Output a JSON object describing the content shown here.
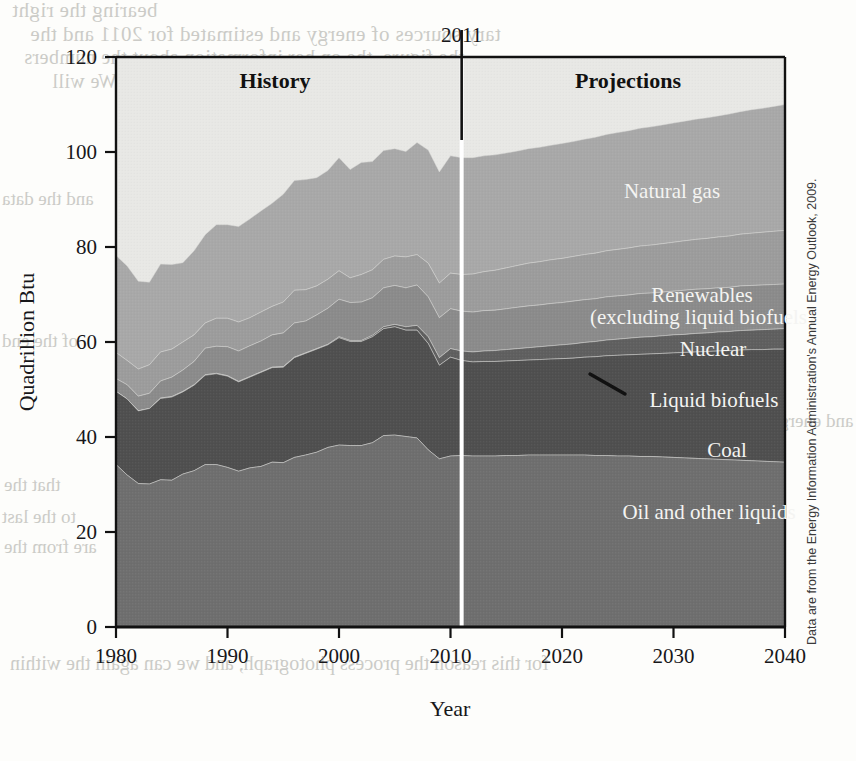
{
  "figure": {
    "period_labels": [
      {
        "text": "History",
        "x": 275,
        "y": 88
      },
      {
        "text": "Projections",
        "x": 628,
        "y": 88
      }
    ],
    "divider_year": "2011",
    "source_note": "Data are from the Energy Information Administration's Annual Energy Outlook, 2009.",
    "bleed_through": [
      "bearing the right ",
      "tary sources of energy and estimated for 2011 and the",
      "the figure, the on her information about the numbers",
      "er the official site of the Department of Energy, We will",
      "of energy and the energy quantities in the",
      "and the data",
      "of the end",
      "that the",
      "to the last",
      "are from the",
      "and the",
      "for this reason the process photograph, and we can again the within",
      "and energy"
    ]
  },
  "chart_data": {
    "type": "area",
    "title": "",
    "subtitle": "",
    "xlabel": "Year",
    "ylabel": "Quadrillion Btu",
    "xlim": [
      1980,
      2040
    ],
    "ylim": [
      0,
      120
    ],
    "xticks": [
      1980,
      1990,
      2000,
      2010,
      2020,
      2030,
      2040
    ],
    "yticks": [
      0,
      20,
      40,
      60,
      80,
      100,
      120
    ],
    "grid": false,
    "stacked": true,
    "legend_position": "inline-annotations",
    "divider": {
      "x": 2011,
      "label": "2011",
      "left_region": "History",
      "right_region": "Projections"
    },
    "colors": {
      "oil_and_other_liquids": "#6e6e6e",
      "coal": "#4f4f4f",
      "liquid_biofuels": "#5f5f5f",
      "nuclear": "#8b8b8b",
      "renewables": "#9c9c9c",
      "natural_gas": "#a8a8a8",
      "plot_background": "#e8e8e5",
      "divider_line": "#111111",
      "projection_split_line": "#ffffff"
    },
    "x": [
      1980,
      1981,
      1982,
      1983,
      1984,
      1985,
      1986,
      1987,
      1988,
      1989,
      1990,
      1991,
      1992,
      1993,
      1994,
      1995,
      1996,
      1997,
      1998,
      1999,
      2000,
      2001,
      2002,
      2003,
      2004,
      2005,
      2006,
      2007,
      2008,
      2009,
      2010,
      2011,
      2012,
      2013,
      2014,
      2015,
      2016,
      2017,
      2018,
      2019,
      2020,
      2021,
      2022,
      2023,
      2024,
      2025,
      2026,
      2027,
      2028,
      2029,
      2030,
      2031,
      2032,
      2033,
      2034,
      2035,
      2036,
      2037,
      2038,
      2039,
      2040
    ],
    "series": [
      {
        "name": "Oil and other liquids",
        "label": "Oil and other liquids",
        "color": "#6e6e6e",
        "values": [
          34.2,
          32.0,
          30.2,
          30.1,
          31.0,
          30.9,
          32.2,
          32.9,
          34.2,
          34.2,
          33.6,
          32.8,
          33.5,
          33.8,
          34.7,
          34.6,
          35.7,
          36.2,
          36.8,
          37.8,
          38.3,
          38.2,
          38.2,
          38.8,
          40.3,
          40.4,
          40.1,
          39.8,
          37.3,
          35.4,
          36.0,
          36.1,
          36.0,
          36.0,
          36.0,
          36.1,
          36.1,
          36.2,
          36.2,
          36.2,
          36.2,
          36.2,
          36.2,
          36.1,
          36.1,
          36.0,
          36.0,
          35.9,
          35.9,
          35.8,
          35.7,
          35.6,
          35.5,
          35.4,
          35.3,
          35.2,
          35.1,
          35.0,
          34.9,
          34.8,
          34.7
        ]
      },
      {
        "name": "Coal",
        "label": "Coal",
        "color": "#4f4f4f",
        "values": [
          15.4,
          16.0,
          15.3,
          15.9,
          17.1,
          17.5,
          17.3,
          18.0,
          18.8,
          19.1,
          19.2,
          18.8,
          19.1,
          19.8,
          19.9,
          20.1,
          21.0,
          21.4,
          21.7,
          21.6,
          22.6,
          21.9,
          21.9,
          22.3,
          22.5,
          22.8,
          22.4,
          22.7,
          22.4,
          19.7,
          20.8,
          20.0,
          19.8,
          19.9,
          19.9,
          19.9,
          20.0,
          20.0,
          20.1,
          20.2,
          20.3,
          20.4,
          20.6,
          20.8,
          21.0,
          21.2,
          21.3,
          21.5,
          21.6,
          21.8,
          22.0,
          22.2,
          22.4,
          22.6,
          22.8,
          23.0,
          23.2,
          23.4,
          23.5,
          23.7,
          23.8
        ]
      },
      {
        "name": "Liquid biofuels",
        "label": "Liquid biofuels",
        "color": "#5f5f5f",
        "values": [
          0.0,
          0.0,
          0.0,
          0.0,
          0.1,
          0.1,
          0.1,
          0.1,
          0.1,
          0.1,
          0.1,
          0.1,
          0.1,
          0.1,
          0.1,
          0.1,
          0.1,
          0.1,
          0.1,
          0.1,
          0.2,
          0.2,
          0.2,
          0.3,
          0.4,
          0.5,
          0.7,
          1.0,
          1.4,
          1.6,
          1.8,
          2.0,
          2.1,
          2.2,
          2.3,
          2.4,
          2.5,
          2.6,
          2.7,
          2.8,
          2.9,
          3.0,
          3.1,
          3.2,
          3.3,
          3.4,
          3.5,
          3.6,
          3.6,
          3.7,
          3.8,
          3.8,
          3.9,
          3.9,
          4.0,
          4.0,
          4.1,
          4.1,
          4.2,
          4.2,
          4.3
        ]
      },
      {
        "name": "Nuclear",
        "label": "Nuclear",
        "color": "#8b8b8b",
        "values": [
          2.7,
          3.0,
          3.1,
          3.2,
          3.6,
          4.1,
          4.5,
          4.9,
          5.6,
          5.7,
          6.1,
          6.4,
          6.5,
          6.5,
          6.8,
          7.1,
          7.2,
          6.7,
          7.1,
          7.6,
          7.9,
          8.0,
          8.1,
          7.9,
          8.2,
          8.2,
          8.2,
          8.5,
          8.4,
          8.4,
          8.4,
          8.4,
          8.4,
          8.5,
          8.5,
          8.6,
          8.7,
          8.8,
          8.8,
          8.9,
          8.9,
          9.0,
          9.0,
          9.0,
          9.1,
          9.1,
          9.1,
          9.2,
          9.2,
          9.2,
          9.2,
          9.3,
          9.3,
          9.3,
          9.3,
          9.3,
          9.4,
          9.4,
          9.4,
          9.4,
          9.4
        ]
      },
      {
        "name": "Renewables (excluding liquid biofuels)",
        "label": "Renewables\n(excluding liquid biofuels)",
        "color": "#9c9c9c",
        "values": [
          5.5,
          5.1,
          5.7,
          6.0,
          6.1,
          5.9,
          5.9,
          5.6,
          5.3,
          5.9,
          6.0,
          6.1,
          5.9,
          6.1,
          6.0,
          6.5,
          6.9,
          6.6,
          6.1,
          6.1,
          6.0,
          5.2,
          5.8,
          5.9,
          6.0,
          6.2,
          6.5,
          6.4,
          7.1,
          7.3,
          7.5,
          7.7,
          8.0,
          8.2,
          8.4,
          8.6,
          8.8,
          9.0,
          9.1,
          9.2,
          9.3,
          9.4,
          9.5,
          9.6,
          9.7,
          9.8,
          9.9,
          10.0,
          10.1,
          10.2,
          10.3,
          10.4,
          10.5,
          10.6,
          10.7,
          10.8,
          10.9,
          11.0,
          11.1,
          11.2,
          11.3
        ]
      },
      {
        "name": "Natural gas",
        "label": "Natural gas",
        "color": "#a8a8a8",
        "values": [
          20.4,
          19.9,
          18.5,
          17.4,
          18.5,
          17.8,
          16.7,
          17.7,
          18.6,
          19.7,
          19.7,
          20.1,
          20.8,
          21.3,
          21.7,
          22.7,
          23.1,
          23.2,
          22.8,
          22.9,
          23.8,
          22.8,
          23.6,
          22.8,
          22.9,
          22.6,
          22.2,
          23.6,
          23.8,
          23.4,
          24.7,
          24.6,
          24.5,
          24.4,
          24.3,
          24.2,
          24.1,
          24.1,
          24.1,
          24.1,
          24.2,
          24.2,
          24.3,
          24.4,
          24.5,
          24.6,
          24.7,
          24.8,
          24.9,
          25.0,
          25.1,
          25.2,
          25.3,
          25.4,
          25.5,
          25.7,
          25.8,
          26.0,
          26.1,
          26.3,
          26.5
        ]
      }
    ],
    "totals": [
      78.2,
      76.0,
      72.8,
      72.6,
      76.4,
      76.3,
      76.7,
      79.2,
      82.6,
      84.7,
      84.7,
      84.3,
      85.9,
      87.6,
      89.2,
      91.1,
      94.0,
      94.2,
      94.6,
      96.1,
      98.8,
      96.3,
      97.8,
      98.0,
      100.3,
      100.7,
      100.1,
      102.0,
      100.4,
      95.8,
      99.2,
      98.8,
      98.8,
      99.2,
      99.4,
      99.8,
      100.2,
      100.7,
      101.0,
      101.4,
      101.8,
      102.2,
      102.7,
      103.1,
      103.7,
      104.1,
      104.5,
      105.0,
      105.3,
      105.7,
      106.1,
      106.5,
      106.9,
      107.2,
      107.6,
      108.0,
      108.5,
      108.9,
      109.2,
      109.6,
      110.0
    ]
  },
  "annotations": {
    "leader_line": {
      "from": {
        "x": 590,
        "y": 374
      },
      "to": {
        "x": 625,
        "y": 394
      },
      "target_series": "Liquid biofuels"
    },
    "series_label_positions": [
      {
        "series": "Natural gas",
        "x": 672,
        "y": 198
      },
      {
        "series": "Renewables",
        "x": 702,
        "y": 302
      },
      {
        "series": "Renewables_line2",
        "x": 702,
        "y": 323
      },
      {
        "series": "Nuclear",
        "x": 713,
        "y": 355
      },
      {
        "series": "Liquid biofuels",
        "x": 714,
        "y": 406
      },
      {
        "series": "Coal",
        "x": 727,
        "y": 456
      },
      {
        "series": "Oil and other liquids",
        "x": 709,
        "y": 518
      }
    ]
  }
}
